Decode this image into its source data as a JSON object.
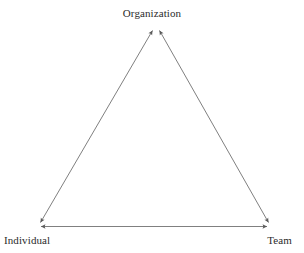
{
  "diagram": {
    "type": "triangle-relationship",
    "background_color": "#ffffff",
    "line_color": "#808080",
    "text_color": "#2b2b2b",
    "line_width": 1,
    "nodes": [
      {
        "id": "organization",
        "label": "Organization",
        "x": 156,
        "y": 25,
        "label_position": "above"
      },
      {
        "id": "individual",
        "label": "Individual",
        "x": 36,
        "y": 227,
        "label_position": "below-left"
      },
      {
        "id": "team",
        "label": "Team",
        "x": 272,
        "y": 227,
        "label_position": "below-right"
      }
    ],
    "edges": [
      {
        "id": "individual-organization",
        "from": "individual",
        "to": "organization",
        "arrow": "double"
      },
      {
        "id": "organization-team",
        "from": "organization",
        "to": "team",
        "arrow": "double"
      },
      {
        "id": "individual-team",
        "from": "individual",
        "to": "team",
        "arrow": "double"
      }
    ]
  }
}
